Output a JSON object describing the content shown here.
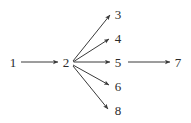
{
  "diagram": {
    "type": "directed-graph",
    "title": "",
    "background_color": "#ffffff",
    "edge_color": "#3a3a3a",
    "label_color": "#2b2b2b",
    "nodes": [
      {
        "id": "1",
        "label": "1",
        "x": 13,
        "y": 62
      },
      {
        "id": "2",
        "label": "2",
        "x": 66,
        "y": 62
      },
      {
        "id": "3",
        "label": "3",
        "x": 118,
        "y": 14
      },
      {
        "id": "4",
        "label": "4",
        "x": 118,
        "y": 38
      },
      {
        "id": "5",
        "label": "5",
        "x": 118,
        "y": 62
      },
      {
        "id": "6",
        "label": "6",
        "x": 118,
        "y": 86
      },
      {
        "id": "7",
        "label": "7",
        "x": 178,
        "y": 62
      },
      {
        "id": "8",
        "label": "8",
        "x": 118,
        "y": 110
      }
    ],
    "edges": [
      {
        "from": "1",
        "to": "2",
        "x1": 21,
        "y1": 62,
        "x2": 58,
        "y2": 62
      },
      {
        "from": "2",
        "to": "3",
        "x1": 73,
        "y1": 61,
        "x2": 110,
        "y2": 15
      },
      {
        "from": "2",
        "to": "4",
        "x1": 73,
        "y1": 62,
        "x2": 109,
        "y2": 39
      },
      {
        "from": "2",
        "to": "5",
        "x1": 74,
        "y1": 62,
        "x2": 110,
        "y2": 62
      },
      {
        "from": "2",
        "to": "6",
        "x1": 73,
        "y1": 65,
        "x2": 109,
        "y2": 85
      },
      {
        "from": "2",
        "to": "8",
        "x1": 73,
        "y1": 66,
        "x2": 108,
        "y2": 109
      },
      {
        "from": "5",
        "to": "7",
        "x1": 128,
        "y1": 62,
        "x2": 170,
        "y2": 62
      }
    ]
  }
}
